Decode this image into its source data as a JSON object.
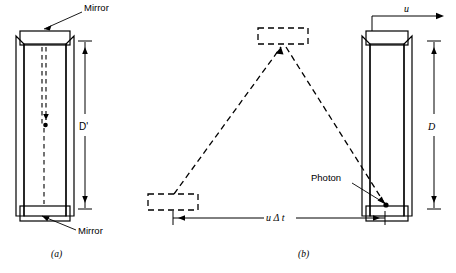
{
  "figure": {
    "panels": [
      {
        "id": "a",
        "caption": "(a)",
        "description": "Stationary light clock, photon travels straight down",
        "dimension_label": "D'",
        "labels": [
          {
            "name": "mirror-top",
            "text": "Mirror"
          },
          {
            "name": "mirror-bottom",
            "text": "Mirror"
          }
        ]
      },
      {
        "id": "b",
        "caption": "(b)",
        "description": "Moving light clock, photon traces a diagonal path",
        "dimension_label": "D",
        "velocity_label": "u",
        "distance_label": "u Δ t",
        "labels": [
          {
            "name": "photon",
            "text": "Photon"
          }
        ]
      }
    ],
    "colors": {
      "stroke": "#000000",
      "background": "#ffffff"
    }
  }
}
